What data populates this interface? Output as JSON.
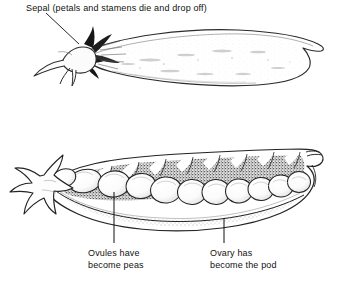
{
  "figure": {
    "background_color": "#ffffff",
    "ink_color": "#111111",
    "annotations": {
      "sepal": {
        "text": "Sepal (petals and stamens die and drop off)"
      },
      "ovules": {
        "line1": "Ovules have",
        "line2": "become peas"
      },
      "ovary": {
        "line1": "Ovary has",
        "line2": "become the pod"
      }
    },
    "illustrations": {
      "whole_pod": {
        "name": "whole-pea-pod",
        "description": "Intact closed pea pod seen from the side, curving up to a pointed tip at the right, with a spiky sepal at the left stem end",
        "pea_count": 0
      },
      "opened_pod": {
        "name": "opened-pea-pod",
        "description": "Pea pod split open lengthwise showing the seeds lying in the pod cavity, stippled interior, spiky sepal at left and hooked tip at right",
        "pea_count": 11
      }
    }
  }
}
